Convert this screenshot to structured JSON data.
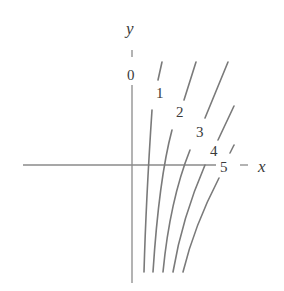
{
  "figure": {
    "type": "level-curves",
    "axes": {
      "x_label": "x",
      "y_label": "y"
    },
    "curve_labels": [
      "0",
      "1",
      "2",
      "3",
      "4",
      "5"
    ],
    "colors": {
      "curves": "#7a7a7a",
      "axes": "#8a8a8a",
      "text": "#3a3a3a",
      "background": "#ffffff"
    }
  }
}
